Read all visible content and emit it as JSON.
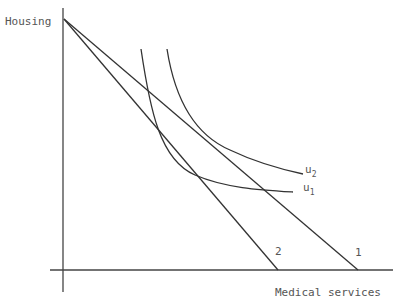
{
  "diagram": {
    "y_axis_label": "Housing",
    "x_axis_label": "Medical services",
    "budget_lines": [
      {
        "label": "1",
        "from": [
          64,
          19
        ],
        "to": [
          358,
          270
        ]
      },
      {
        "label": "2",
        "from": [
          64,
          19
        ],
        "to": [
          278,
          270
        ]
      }
    ],
    "indifference_curves": [
      {
        "label": "u",
        "subscript": "1"
      },
      {
        "label": "u",
        "subscript": "2"
      }
    ],
    "colors": {
      "line": "#333333",
      "text": "#555555"
    }
  }
}
